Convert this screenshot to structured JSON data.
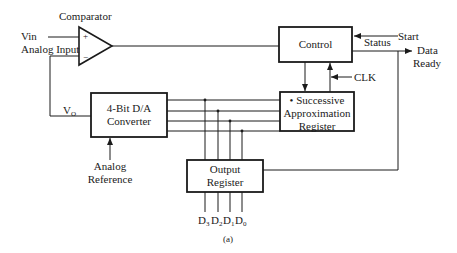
{
  "figure": {
    "caption": "(a)",
    "colors": {
      "stroke": "#1a1a1a",
      "background": "#ffffff"
    }
  },
  "comparator": {
    "title": "Comparator",
    "plus": "+",
    "minus": "−"
  },
  "inputs": {
    "vin": "Vin",
    "analog_input": "Analog Input",
    "vo_main": "V",
    "vo_sub": "O",
    "analog_reference_line1": "Analog",
    "analog_reference_line2": "Reference",
    "start": "Start",
    "clk": "CLK"
  },
  "outputs": {
    "status": "Status",
    "data_ready_line1": "Data",
    "data_ready_line2": "Ready",
    "bits": [
      {
        "main": "D",
        "sub": "3"
      },
      {
        "main": "D",
        "sub": "2"
      },
      {
        "main": "D",
        "sub": "1"
      },
      {
        "main": "D",
        "sub": "0"
      }
    ]
  },
  "blocks": {
    "control": "Control",
    "dac_line1": "4-Bit D/A",
    "dac_line2": "Converter",
    "sar_line1": "• Successive",
    "sar_line2": "Approximation",
    "sar_line3": "Register",
    "output_reg_line1": "Output",
    "output_reg_line2": "Register"
  }
}
